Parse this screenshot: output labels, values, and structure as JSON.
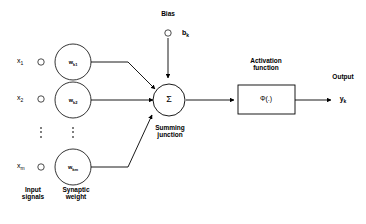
{
  "diagram": {
    "background_color": "#ffffff",
    "stroke_color": "#000000",
    "inputs": [
      {
        "signal": "x",
        "signal_sub": "1",
        "weight": "w",
        "weight_sub": "k1"
      },
      {
        "signal": "x",
        "signal_sub": "2",
        "weight": "w",
        "weight_sub": "k2"
      },
      {
        "signal": "x",
        "signal_sub": "m",
        "weight": "w",
        "weight_sub": "km"
      }
    ],
    "labels": {
      "input_signals_line1": "Input",
      "input_signals_line2": "signals",
      "synaptic_weight_line1": "Synaptic",
      "synaptic_weight_line2": "weight",
      "bias": "Bias",
      "bias_symbol": "b",
      "bias_symbol_sub": "k",
      "summing_junction_line1": "Summing",
      "summing_junction_line2": "junction",
      "summing_symbol": "Σ",
      "activation_function_line1": "Activation",
      "activation_function_line2": "function",
      "activation_symbol": "Φ(.)",
      "output": "Output",
      "output_symbol": "y",
      "output_symbol_sub": "k",
      "ellipsis": "⋮"
    }
  }
}
